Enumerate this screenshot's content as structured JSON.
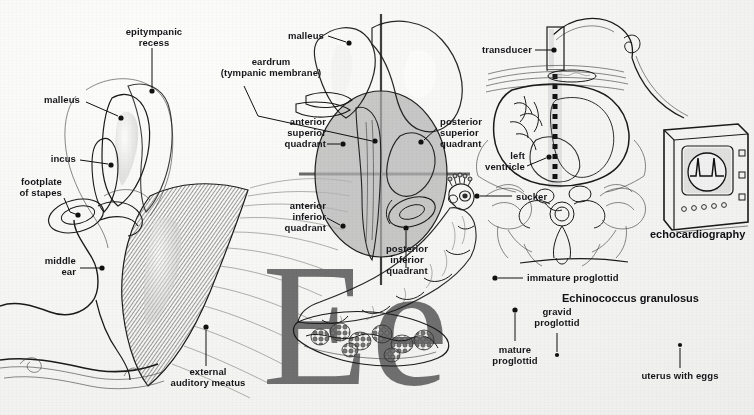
{
  "page": {
    "letter": "Ee",
    "background_color": "#f7f7f6",
    "letter_color": "#6f6f70",
    "ink_color": "#1a1a1a",
    "width": 754,
    "height": 415
  },
  "figures": [
    {
      "id": "middle-ear",
      "title": "",
      "labels": [
        {
          "key": "epitympanic_recess",
          "text": "epitympanic\nrecess"
        },
        {
          "key": "malleus",
          "text": "malleus"
        },
        {
          "key": "incus",
          "text": "incus"
        },
        {
          "key": "footplate_of_stapes",
          "text": "footplate\nof stapes"
        },
        {
          "key": "middle_ear",
          "text": "middle\near"
        },
        {
          "key": "external_auditory_meatus",
          "text": "external\nauditory meatus"
        }
      ]
    },
    {
      "id": "eardrum-quadrants",
      "title": "",
      "labels": [
        {
          "key": "malleus",
          "text": "malleus"
        },
        {
          "key": "eardrum",
          "text": "eardrum\n(tympanic membrane)"
        },
        {
          "key": "anterior_superior_quadrant",
          "text": "anterior\nsuperior\nquadrant"
        },
        {
          "key": "posterior_superior_quadrant",
          "text": "posterior\nsuperior\nquadrant"
        },
        {
          "key": "anterior_inferior_quadrant",
          "text": "anterior\ninferior\nquadrant"
        },
        {
          "key": "posterior_inferior_quadrant",
          "text": "posterior\ninferior\nquadrant"
        }
      ]
    },
    {
      "id": "echocardiography",
      "title": "echocardiography",
      "labels": [
        {
          "key": "transducer",
          "text": "transducer"
        },
        {
          "key": "left_ventricle",
          "text": "left\nventricle"
        }
      ]
    },
    {
      "id": "echinococcus",
      "title": "Echinococcus granulosus",
      "labels": [
        {
          "key": "sucker",
          "text": "sucker"
        },
        {
          "key": "immature_proglottid",
          "text": "immature proglottid"
        },
        {
          "key": "mature_proglottid",
          "text": "mature\nproglottid"
        },
        {
          "key": "gravid_proglottid",
          "text": "gravid\nproglottid"
        },
        {
          "key": "uterus_with_eggs",
          "text": "uterus with eggs"
        }
      ]
    }
  ]
}
